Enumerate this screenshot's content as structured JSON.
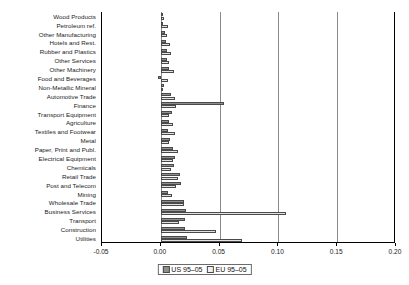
{
  "chart_data": {
    "type": "bar",
    "orientation": "horizontal",
    "title": "",
    "xlabel": "",
    "ylabel": "",
    "xlim": [
      -0.05,
      0.2
    ],
    "xticks": [
      -0.05,
      0.0,
      0.05,
      0.1,
      0.15,
      0.2
    ],
    "xticklabels": [
      "-0.05",
      "0.00",
      "0.05",
      "0.10",
      "0.15",
      "0.20"
    ],
    "grid": true,
    "gridlines_at": [
      0.0,
      0.05,
      0.1,
      0.15
    ],
    "legend_position": "bottom-center",
    "categories": [
      "Wood Products",
      "Petroleum ref.",
      "Other Manufacturing",
      "Hotels and Rest.",
      "Rubber and Plastics",
      "Other Services",
      "Other Machinery",
      "Food and Beverages",
      "Non-Metallic Mineral",
      "Automotive Trade",
      "Finance",
      "Transport Equipment",
      "Agriculture",
      "Textiles and Footwear",
      "Metal",
      "Paper, Print and Publ.",
      "Electrical Equipment",
      "Chemicals",
      "Retail Trade",
      "Post and Telecom",
      "Mining",
      "Wholesale Trade",
      "Business Services",
      "Transport",
      "Construction",
      "Utilities"
    ],
    "series": [
      {
        "name": "US 95–05",
        "color": "#8f8f8f",
        "values": [
          0.0016,
          0.0022,
          0.0038,
          0.004,
          0.0049,
          0.0052,
          0.0068,
          -0.002,
          0.003,
          0.0086,
          0.054,
          0.0095,
          0.0073,
          0.006,
          0.0075,
          0.0104,
          0.0122,
          0.0112,
          0.016,
          0.0171,
          0.006,
          0.02,
          0.0215,
          0.021,
          0.0203,
          0.022
        ]
      },
      {
        "name": "EU 95–05",
        "color": "#e2e2e2",
        "values": [
          0.0028,
          0.006,
          0.005,
          0.0082,
          0.009,
          0.0068,
          0.0114,
          0.0058,
          0.0018,
          0.0125,
          0.013,
          0.0072,
          0.0103,
          0.0118,
          0.007,
          0.0143,
          0.01,
          0.009,
          0.0143,
          0.013,
          0.0095,
          0.0198,
          0.1065,
          0.0155,
          0.047,
          0.069
        ]
      }
    ]
  },
  "legend": {
    "items": [
      {
        "label": "US 95–05",
        "swatch": "us"
      },
      {
        "label": "EU 95–05",
        "swatch": "eu"
      }
    ]
  }
}
